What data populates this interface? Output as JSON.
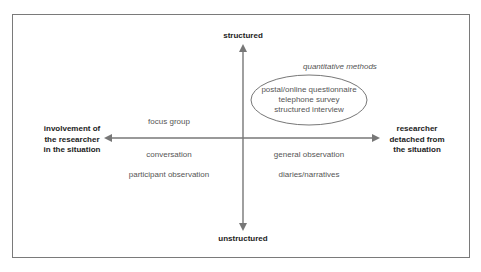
{
  "diagram": {
    "axes": {
      "top": "structured",
      "bottom": "unstructured",
      "left": "involvement of\nthe researcher\nin the situation",
      "right": "researcher\ndetached from\nthe situation"
    },
    "group_label": "quantitative methods",
    "ellipse_items": [
      "postal/online questionnaire",
      "telephone survey",
      "structured interview"
    ],
    "quadrants": {
      "upper_left": [
        "focus group"
      ],
      "lower_left": [
        "conversation",
        "participant observation"
      ],
      "lower_right": [
        "general observation",
        "diaries/narratives"
      ]
    },
    "colors": {
      "line": "#777777",
      "frame": "#7a7a7a",
      "label_text": "#555555",
      "axis_text": "#222222"
    }
  }
}
